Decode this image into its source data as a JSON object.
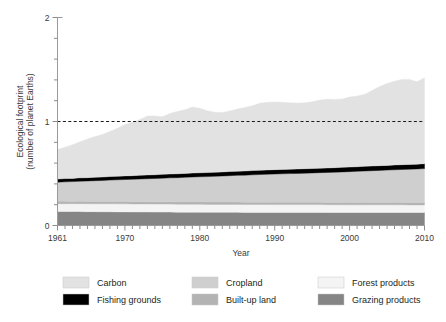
{
  "axes": {
    "ylabel_line1": "Ecological footprint",
    "ylabel_line2": "(number of planet Earths)",
    "xlabel": "Year",
    "ytick_labels": [
      "0",
      "1",
      "2"
    ],
    "xtick_labels": [
      "1961",
      "1970",
      "1980",
      "1990",
      "2000",
      "2010"
    ]
  },
  "legend": {
    "items": [
      {
        "label": "Carbon",
        "color": "#e2e2e2",
        "swatch": "swatch-carbon"
      },
      {
        "label": "Cropland",
        "color": "#cfcfcf",
        "swatch": "swatch-cropland"
      },
      {
        "label": "Forest products",
        "color": "#f4f4f4",
        "swatch": "swatch-forest-products"
      },
      {
        "label": "Fishing grounds",
        "color": "#000000",
        "swatch": "swatch-fishing-grounds"
      },
      {
        "label": "Built-up land",
        "color": "#b3b3b3",
        "swatch": "swatch-built-up-land"
      },
      {
        "label": "Grazing products",
        "color": "#858585",
        "swatch": "swatch-grazing-products"
      }
    ]
  },
  "chart_data": {
    "type": "area",
    "title": "",
    "xlabel": "Year",
    "ylabel": "Ecological footprint (number of planet Earths)",
    "xlim": [
      1961,
      2010
    ],
    "ylim": [
      0,
      2
    ],
    "grid": false,
    "legend_position": "below",
    "stacked": true,
    "reference_lines": [
      {
        "y": 1,
        "style": "dashed",
        "label": ""
      }
    ],
    "ytick_values": [
      0,
      1,
      2
    ],
    "yminor_step": 0.2,
    "xtick_values": [
      1961,
      1970,
      1980,
      1990,
      2000,
      2010
    ],
    "xminor_step": 1,
    "x": [
      1961,
      1962,
      1963,
      1964,
      1965,
      1966,
      1967,
      1968,
      1969,
      1970,
      1971,
      1972,
      1973,
      1974,
      1975,
      1976,
      1977,
      1978,
      1979,
      1980,
      1981,
      1982,
      1983,
      1984,
      1985,
      1986,
      1987,
      1988,
      1989,
      1990,
      1991,
      1992,
      1993,
      1994,
      1995,
      1996,
      1997,
      1998,
      1999,
      2000,
      2001,
      2002,
      2003,
      2004,
      2005,
      2006,
      2007,
      2008,
      2009,
      2010
    ],
    "series": [
      {
        "name": "Grazing products",
        "color": "#858585",
        "values": [
          0.135,
          0.135,
          0.134,
          0.134,
          0.133,
          0.133,
          0.132,
          0.132,
          0.131,
          0.131,
          0.13,
          0.13,
          0.13,
          0.129,
          0.129,
          0.129,
          0.128,
          0.128,
          0.128,
          0.128,
          0.127,
          0.127,
          0.127,
          0.127,
          0.127,
          0.126,
          0.126,
          0.126,
          0.126,
          0.126,
          0.126,
          0.126,
          0.126,
          0.126,
          0.126,
          0.126,
          0.125,
          0.125,
          0.125,
          0.125,
          0.125,
          0.125,
          0.125,
          0.125,
          0.125,
          0.125,
          0.125,
          0.125,
          0.125,
          0.125
        ]
      },
      {
        "name": "Forest products",
        "color": "#f4f4f4",
        "values": [
          0.075,
          0.075,
          0.075,
          0.076,
          0.076,
          0.076,
          0.076,
          0.077,
          0.077,
          0.077,
          0.077,
          0.077,
          0.077,
          0.077,
          0.077,
          0.077,
          0.077,
          0.077,
          0.077,
          0.077,
          0.076,
          0.076,
          0.076,
          0.076,
          0.076,
          0.076,
          0.076,
          0.076,
          0.076,
          0.075,
          0.075,
          0.075,
          0.075,
          0.075,
          0.075,
          0.075,
          0.075,
          0.074,
          0.074,
          0.074,
          0.074,
          0.074,
          0.074,
          0.074,
          0.074,
          0.074,
          0.074,
          0.073,
          0.073,
          0.073
        ]
      },
      {
        "name": "Built-up land",
        "color": "#b3b3b3",
        "values": [
          0.022,
          0.022,
          0.022,
          0.022,
          0.022,
          0.022,
          0.022,
          0.022,
          0.022,
          0.022,
          0.022,
          0.022,
          0.022,
          0.022,
          0.022,
          0.022,
          0.022,
          0.022,
          0.022,
          0.022,
          0.022,
          0.022,
          0.022,
          0.022,
          0.022,
          0.022,
          0.022,
          0.022,
          0.022,
          0.022,
          0.022,
          0.022,
          0.022,
          0.022,
          0.022,
          0.022,
          0.022,
          0.022,
          0.022,
          0.022,
          0.022,
          0.022,
          0.022,
          0.022,
          0.022,
          0.022,
          0.022,
          0.022,
          0.022,
          0.022
        ]
      },
      {
        "name": "Cropland",
        "color": "#cfcfcf",
        "values": [
          0.185,
          0.188,
          0.191,
          0.194,
          0.197,
          0.2,
          0.203,
          0.206,
          0.209,
          0.212,
          0.215,
          0.218,
          0.221,
          0.224,
          0.227,
          0.23,
          0.233,
          0.236,
          0.239,
          0.242,
          0.245,
          0.248,
          0.251,
          0.254,
          0.257,
          0.26,
          0.263,
          0.266,
          0.269,
          0.272,
          0.274,
          0.276,
          0.278,
          0.28,
          0.282,
          0.285,
          0.288,
          0.291,
          0.294,
          0.297,
          0.3,
          0.303,
          0.306,
          0.309,
          0.312,
          0.315,
          0.318,
          0.321,
          0.324,
          0.327
        ]
      },
      {
        "name": "Fishing grounds",
        "color": "#000000",
        "values": [
          0.03,
          0.031,
          0.031,
          0.032,
          0.032,
          0.033,
          0.033,
          0.034,
          0.034,
          0.035,
          0.035,
          0.036,
          0.036,
          0.036,
          0.037,
          0.037,
          0.037,
          0.038,
          0.038,
          0.038,
          0.039,
          0.039,
          0.039,
          0.04,
          0.04,
          0.04,
          0.041,
          0.041,
          0.041,
          0.042,
          0.042,
          0.042,
          0.042,
          0.043,
          0.043,
          0.043,
          0.043,
          0.044,
          0.044,
          0.044,
          0.044,
          0.045,
          0.045,
          0.045,
          0.045,
          0.046,
          0.046,
          0.046,
          0.046,
          0.047
        ]
      },
      {
        "name": "Carbon",
        "color": "#e2e2e2",
        "values": [
          0.283,
          0.301,
          0.324,
          0.348,
          0.371,
          0.392,
          0.41,
          0.434,
          0.462,
          0.494,
          0.514,
          0.536,
          0.567,
          0.566,
          0.554,
          0.583,
          0.6,
          0.612,
          0.636,
          0.62,
          0.594,
          0.578,
          0.571,
          0.583,
          0.598,
          0.61,
          0.624,
          0.645,
          0.652,
          0.65,
          0.645,
          0.639,
          0.634,
          0.635,
          0.642,
          0.655,
          0.662,
          0.656,
          0.657,
          0.673,
          0.68,
          0.692,
          0.726,
          0.762,
          0.788,
          0.806,
          0.82,
          0.818,
          0.793,
          0.826
        ]
      }
    ],
    "total_label": "Total ecological footprint",
    "total_values": [
      0.73,
      0.752,
      0.777,
      0.806,
      0.831,
      0.856,
      0.876,
      0.905,
      0.935,
      0.971,
      0.993,
      1.019,
      1.053,
      1.054,
      1.046,
      1.078,
      1.097,
      1.113,
      1.14,
      1.127,
      1.103,
      1.09,
      1.086,
      1.102,
      1.12,
      1.134,
      1.152,
      1.176,
      1.186,
      1.187,
      1.184,
      1.18,
      1.177,
      1.181,
      1.19,
      1.206,
      1.215,
      1.212,
      1.216,
      1.235,
      1.245,
      1.261,
      1.298,
      1.339,
      1.37,
      1.392,
      1.409,
      1.409,
      1.387,
      1.423
    ]
  }
}
